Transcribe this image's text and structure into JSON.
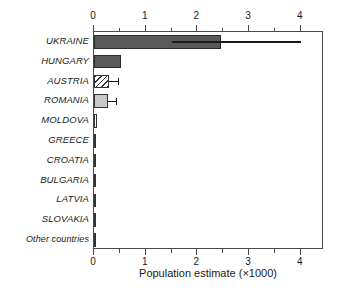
{
  "chart_data": {
    "type": "bar",
    "orientation": "horizontal",
    "title": "",
    "xlabel": "Population estimate (×1000)",
    "ylabel": "",
    "xlim": [
      0,
      4.45
    ],
    "xticks": [
      0,
      1,
      2,
      3,
      4
    ],
    "xticklabels": [
      "0",
      "1",
      "2",
      "3",
      "4"
    ],
    "minor_tick_step": 0.5,
    "grid": false,
    "legend": null,
    "dual_x_axis": true,
    "categories": [
      "UKRAINE",
      "HUNGARY",
      "AUSTRIA",
      "ROMANIA",
      "MOLDOVA",
      "GREECE",
      "CROATIA",
      "BULGARIA",
      "LATVIA",
      "SLOVAKIA",
      "Other countries"
    ],
    "values": [
      2.45,
      0.52,
      0.29,
      0.27,
      0.06,
      0.012,
      0.012,
      0.01,
      0.008,
      0.008,
      0.008
    ],
    "errors_low": [
      1.5,
      null,
      null,
      null,
      null,
      null,
      null,
      null,
      null,
      null,
      null
    ],
    "errors_high": [
      4.0,
      null,
      0.46,
      0.42,
      null,
      null,
      null,
      null,
      null,
      null,
      null
    ],
    "bar_styles": [
      "dark",
      "dark",
      "hatch",
      "light",
      "white",
      "white",
      "white",
      "white",
      "white",
      "white",
      "white"
    ],
    "colors": {
      "dark_fill": "#595959",
      "light_fill": "#c9c9c9",
      "white_fill": "#ffffff",
      "bar_outline": "#333333",
      "axis": "#4a4a4a",
      "text": "#1a1a1a"
    }
  }
}
